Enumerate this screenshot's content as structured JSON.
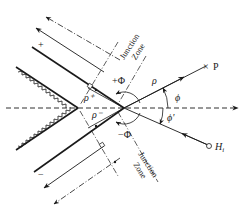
{
  "diagram": {
    "type": "wedge-diffraction-geometry",
    "labels": {
      "plus_face": "+",
      "minus_face": "−",
      "plus_phi": "+Φ",
      "minus_phi": "−Φ",
      "rho": "ρ",
      "rho_plus": "ρ⁺",
      "rho_minus": "ρ⁻",
      "phi": "ϕ",
      "phi_prime": "ϕ'",
      "observation_point": "P",
      "source": "H",
      "source_subscript": "i",
      "junction_zone_upper_line1": "Junction",
      "junction_zone_upper_line2": "Zone",
      "junction_zone_lower_line1": "Junction",
      "junction_zone_lower_line2": "Zone"
    },
    "colors": {
      "ink": "#1a1a1a",
      "background": "#ffffff"
    }
  }
}
